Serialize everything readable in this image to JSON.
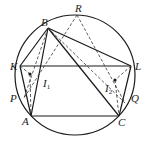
{
  "diagram": {
    "circle": {
      "cx": 75,
      "cy": 75,
      "r": 60
    },
    "points": {
      "B": {
        "x": 48,
        "y": 28,
        "label": "B",
        "lx": 41,
        "ly": 26
      },
      "R": {
        "x": 77,
        "y": 15,
        "label": "R",
        "lx": 75,
        "ly": 12
      },
      "K": {
        "x": 20,
        "y": 66,
        "label": "K",
        "lx": 10,
        "ly": 70
      },
      "L": {
        "x": 131,
        "y": 66,
        "label": "L",
        "lx": 135,
        "ly": 70
      },
      "A": {
        "x": 31,
        "y": 116,
        "label": "A",
        "lx": 22,
        "ly": 125
      },
      "C": {
        "x": 119,
        "y": 116,
        "label": "C",
        "lx": 118,
        "ly": 126
      },
      "P": {
        "x": 24,
        "y": 98,
        "label": "P",
        "lx": 10,
        "ly": 102
      },
      "Q": {
        "x": 125,
        "y": 103,
        "label": "Q",
        "lx": 131,
        "ly": 102
      },
      "I1": {
        "x": 30,
        "y": 74,
        "label": "I",
        "sub": "1",
        "lx": 43,
        "ly": 87
      },
      "I2": {
        "x": 115,
        "y": 80,
        "label": "I",
        "sub": "2",
        "lx": 105,
        "ly": 92
      }
    },
    "solid_segments": [
      [
        "B",
        "K"
      ],
      [
        "B",
        "A"
      ],
      [
        "B",
        "C"
      ],
      [
        "B",
        "L"
      ],
      [
        "K",
        "L"
      ],
      [
        "A",
        "C"
      ],
      [
        "K",
        "A"
      ],
      [
        "L",
        "C"
      ]
    ],
    "dashed_segments": [
      [
        "B",
        "P"
      ],
      [
        "B",
        "Q"
      ],
      [
        "R",
        "P"
      ],
      [
        "R",
        "Q"
      ],
      [
        "K",
        "I1"
      ],
      [
        "I1",
        "A"
      ],
      [
        "L",
        "I2"
      ],
      [
        "I2",
        "C"
      ]
    ]
  }
}
